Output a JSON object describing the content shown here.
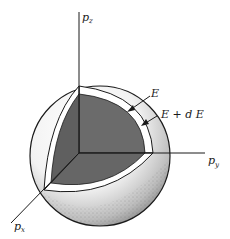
{
  "diagram": {
    "type": "momentum-space-sphere",
    "axes": {
      "pz": {
        "label": "p",
        "subscript": "z"
      },
      "py": {
        "label": "p",
        "subscript": "y"
      },
      "px": {
        "label": "p",
        "subscript": "x"
      }
    },
    "annotations": {
      "inner": "E",
      "outer": "E + d E"
    },
    "colors": {
      "octant_fill": "#6b6b6b",
      "shell": "#ffffff",
      "line": "#1a1a1a"
    }
  }
}
